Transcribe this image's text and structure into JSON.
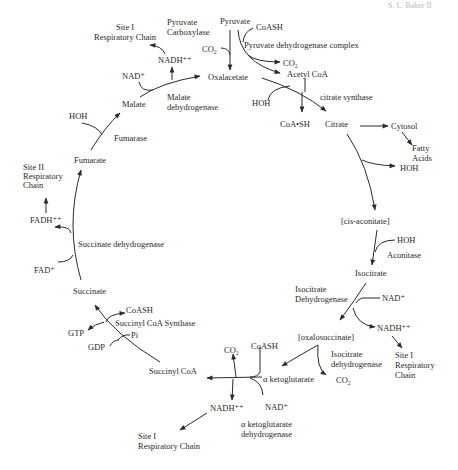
{
  "header": {
    "text": "S. L. Baker II"
  },
  "cycle": {
    "title": "Citric Acid (Krebs) Cycle",
    "metabolites": {
      "pyruvate": "Pyruvate",
      "oxalacetate": "Oxalacetate",
      "acetyl_coa": "Acetyl CoA",
      "citrate": "Citrate",
      "cis_aconitate": "[cis-aconitate]",
      "isocitrate": "Isocitrate",
      "oxalosuccinate": "[oxalosuccinate]",
      "alpha_ketoglutarate": "α ketoglutarate",
      "succinyl_coa": "Succinyl CoA",
      "succinate": "Succinate",
      "fumarate": "Fumarate",
      "malate": "Malate"
    },
    "enzymes": {
      "pyruvate_carboxylase": [
        "Pyruvate",
        "Carboxylase"
      ],
      "pyruvate_dehydrogenase": "Pyruvate dehydrogenase complex",
      "citrate_synthase": "citrate synthase",
      "aconitase": "Aconitase",
      "isocitrate_dehydrogenase_1": [
        "Isocitrate",
        "Dehydrogenase"
      ],
      "isocitrate_dehydrogenase_2": [
        "Isocitrate",
        "dehydrogenase"
      ],
      "akg_dehydrogenase": [
        "α ketoglutarate",
        "dehydrogenase"
      ],
      "succinyl_coa_synthase": "Succinyl CoA Synthase",
      "succinate_dehydrogenase": "Succinate dehydrogenase",
      "fumarase": "Fumarase",
      "malate_dehydrogenase": [
        "Malate",
        "dehydrogenase"
      ]
    },
    "cofactors": {
      "coash_top": "CoASH",
      "co2_pdh": "CO₂",
      "co2_pc": "CO₂",
      "hoh_cs": "HOH",
      "coa_sh": "CoA•SH",
      "cytosol": "Cytosol",
      "fatty_acids": [
        "Fatty",
        "Acids"
      ],
      "hoh_citrate": "HOH",
      "hoh_aconitase": "HOH",
      "nad_icd": "NAD⁺",
      "nadh_icd": "NADH⁺⁺",
      "site1_icd": [
        "Site I",
        "Respiratory",
        "Chain"
      ],
      "co2_icd": "CO₂",
      "co2_akg": "CO₂",
      "coash_akg": "CoASH",
      "nadh_akg": "NADH⁺⁺",
      "nad_akg": "NAD⁺",
      "site1_akg": [
        "Site I",
        "Respiratory Chain"
      ],
      "coash_scs": "CoASH",
      "pi": "Pi",
      "gtp": "GTP",
      "gdp": "GDP",
      "fad": "FAD⁺",
      "fadh": "FADH⁺⁺",
      "site2": [
        "Site II",
        "Respiratory",
        "Chain"
      ],
      "hoh_fumarase": "HOH",
      "nad_mdh": "NAD⁺",
      "nadh_mdh": "NADH⁺⁺",
      "site1_mdh": [
        "Site I",
        "Respiratory Chain"
      ]
    }
  }
}
